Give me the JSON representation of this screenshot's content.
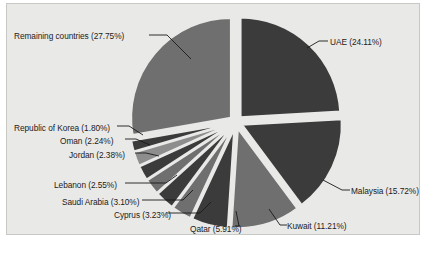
{
  "figure": {
    "background_color": "#ffffff",
    "plot_background_color": "#e9e9e7",
    "plot_border_color": "#c8c8c4",
    "label_text_color": "#1b1b1b",
    "leader_line_color": "#1a1a1a"
  },
  "chart_data": {
    "type": "pie",
    "title": "",
    "subtitle": "",
    "xlabel": "",
    "ylabel": "",
    "grid": false,
    "legend_position": "none",
    "label_format": "{name} ({value}%)",
    "exploded": true,
    "start_angle_deg": -90,
    "direction": "clockwise",
    "units": "percent",
    "total": 100.0,
    "categories": [
      "UAE",
      "Malaysia",
      "Kuwait",
      "Qatar",
      "Cyprus",
      "Saudi Arabia",
      "Lebanon",
      "Jordan",
      "Oman",
      "Republic of Korea",
      "Remaining countries"
    ],
    "values": [
      24.11,
      15.72,
      11.21,
      5.91,
      3.23,
      3.1,
      2.55,
      2.38,
      2.24,
      1.8,
      27.75
    ],
    "slices": [
      {
        "name": "UAE",
        "value": 24.11,
        "label": "UAE (24.11%)",
        "color": "#3b3b3b",
        "label_side": "right",
        "label_x": 323,
        "label_y": 33,
        "leader": "M 300 44 L 312 37 L 321 37"
      },
      {
        "name": "Malaysia",
        "value": 15.72,
        "label": "Malaysia (15.72%)",
        "color": "#3b3b3b",
        "label_side": "right",
        "label_x": 344,
        "label_y": 182,
        "leader": "M 316 176 L 335 186 L 343 186"
      },
      {
        "name": "Kuwait",
        "value": 11.21,
        "label": "Kuwait (11.21%)",
        "color": "#6f6f6f",
        "label_side": "right",
        "label_x": 280,
        "label_y": 217,
        "leader": "M 262 205 L 273 221 L 280 221"
      },
      {
        "name": "Qatar",
        "value": 5.91,
        "label": "Qatar (5.91%)",
        "color": "#3b3b3b",
        "label_side": "left",
        "label_x": 183,
        "label_y": 220,
        "leader": "M 229 207 L 232 222 L 228 222"
      },
      {
        "name": "Cyprus",
        "value": 3.23,
        "label": "Cyprus (3.23%)",
        "color": "#6f6f6f",
        "label_side": "left",
        "label_x": 107,
        "label_y": 206,
        "leader": "M 204 198 L 193 209 L 159 209"
      },
      {
        "name": "Saudi Arabia",
        "value": 3.1,
        "label": "Saudi Arabia (3.10%)",
        "color": "#3b3b3b",
        "label_side": "left",
        "label_x": 55,
        "label_y": 193,
        "leader": "M 186 186 L 176 196 L 135 196"
      },
      {
        "name": "Lebanon",
        "value": 2.55,
        "label": "Lebanon (2.55%)",
        "color": "#6f6f6f",
        "label_side": "left",
        "label_x": 47,
        "label_y": 176,
        "leader": "M 170 171 L 159 179 L 118 179"
      },
      {
        "name": "Jordan",
        "value": 2.38,
        "label": "Jordan (2.38%)",
        "color": "#3b3b3b",
        "label_side": "left",
        "label_x": 62,
        "label_y": 146,
        "leader": "M 152 152 L 139 149 L 128 149"
      },
      {
        "name": "Oman",
        "value": 2.24,
        "label": "Oman (2.24%)",
        "color": "#8d8d8d",
        "label_side": "left",
        "label_x": 53,
        "label_y": 132,
        "leader": "M 143 141 L 129 135 L 118 135"
      },
      {
        "name": "Republic of Korea",
        "value": 1.8,
        "label": "Republic of Korea (1.80%)",
        "color": "#3b3b3b",
        "label_side": "left",
        "label_x": 7,
        "label_y": 119,
        "leader": "M 136 131 L 122 122 L 110 122"
      },
      {
        "name": "Remaining countries",
        "value": 27.75,
        "label": "Remaining countries (27.75%)",
        "color": "#6f6f6f",
        "label_side": "left",
        "label_x": 7,
        "label_y": 27,
        "leader": "M 184 55 L 160 31 L 142 31"
      }
    ]
  }
}
